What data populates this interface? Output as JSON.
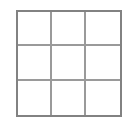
{
  "canvas": {
    "width": 136,
    "height": 124,
    "background_color": "#ffffff"
  },
  "board": {
    "name": "3x3 grid",
    "rows": 3,
    "columns": 3,
    "border_color": "#828282",
    "border_width_px": 2,
    "gridline_color": "#9a9a9a",
    "gridline_width_px": 2,
    "cell_fill_color": "#ffffff",
    "left_px": 16,
    "top_px": 10,
    "width_px": 106,
    "height_px": 107,
    "cells": [
      {
        "id": "r1c1",
        "row": 1,
        "column": 1,
        "label": ""
      },
      {
        "id": "r1c2",
        "row": 1,
        "column": 2,
        "label": ""
      },
      {
        "id": "r1c3",
        "row": 1,
        "column": 3,
        "label": ""
      },
      {
        "id": "r2c1",
        "row": 2,
        "column": 1,
        "label": ""
      },
      {
        "id": "r2c2",
        "row": 2,
        "column": 2,
        "label": ""
      },
      {
        "id": "r2c3",
        "row": 2,
        "column": 3,
        "label": ""
      },
      {
        "id": "r3c1",
        "row": 3,
        "column": 1,
        "label": ""
      },
      {
        "id": "r3c2",
        "row": 3,
        "column": 2,
        "label": ""
      },
      {
        "id": "r3c3",
        "row": 3,
        "column": 3,
        "label": ""
      }
    ]
  }
}
